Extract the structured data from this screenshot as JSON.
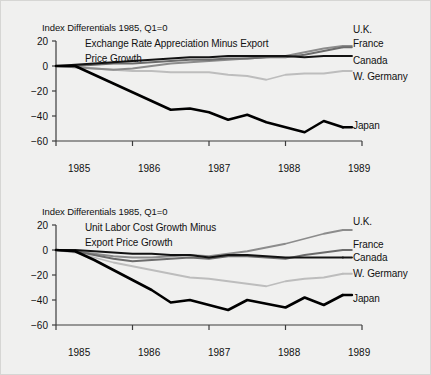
{
  "figure": {
    "background_color": "#f0f0ef",
    "text_color": "#111111"
  },
  "series_colors": {
    "uk": "#8c8c8c",
    "france": "#6b6b6b",
    "canada": "#121212",
    "w_germany": "#bdbdbd",
    "japan": "#000000"
  },
  "panels": [
    {
      "id": "exchange-rate",
      "note": "Index Differentials 1985, Q1=0",
      "subtitle_lines": [
        "Exchange Rate Appreciation Minus Export",
        "Price Growth"
      ],
      "y_ticks": [
        "20",
        "0",
        "−20",
        "−40",
        "−60"
      ],
      "x_ticks": [
        "1985",
        "1986",
        "1987",
        "1988",
        "1989"
      ],
      "series_labels": [
        "U.K.",
        "France",
        "Canada",
        "W. Germany",
        "Japan"
      ]
    },
    {
      "id": "unit-labor-cost",
      "note": "Index Differentials 1985, Q1=0",
      "subtitle_lines": [
        "Unit Labor Cost Growth Minus",
        "Export Price Growth"
      ],
      "y_ticks": [
        "20",
        "0",
        "−20",
        "−40",
        "−60"
      ],
      "x_ticks": [
        "1985",
        "1986",
        "1987",
        "1988",
        "1989"
      ],
      "series_labels": [
        "U.K.",
        "France",
        "Canada",
        "W. Germany",
        "Japan"
      ]
    }
  ],
  "chart_data": [
    {
      "type": "line",
      "title": "Exchange Rate Appreciation Minus Export Price Growth",
      "subtitle": "Index Differentials 1985, Q1=0",
      "xlabel": "",
      "ylabel": "",
      "xlim": [
        1985.0,
        1989.0
      ],
      "ylim": [
        -60,
        20
      ],
      "yticks": [
        20,
        0,
        -20,
        -40,
        -60
      ],
      "xticks": [
        1985,
        1986,
        1987,
        1988,
        1989
      ],
      "grid": false,
      "legend": "right-inline-labels",
      "x": [
        1985.0,
        1985.25,
        1985.5,
        1985.75,
        1986.0,
        1986.25,
        1986.5,
        1986.75,
        1987.0,
        1987.25,
        1987.5,
        1987.75,
        1988.0,
        1988.25,
        1988.5,
        1988.75
      ],
      "series": [
        {
          "name": "U.K.",
          "color": "#8c8c8c",
          "values": [
            0,
            -1,
            -2,
            -3,
            -2,
            0,
            2,
            3,
            4,
            5,
            6,
            7,
            8,
            11,
            14,
            16
          ]
        },
        {
          "name": "France",
          "color": "#6b6b6b",
          "values": [
            0,
            0,
            1,
            2,
            2,
            3,
            4,
            5,
            5,
            6,
            6,
            7,
            7,
            9,
            12,
            15
          ]
        },
        {
          "name": "Canada",
          "color": "#121212",
          "values": [
            0,
            1,
            2,
            3,
            4,
            5,
            6,
            7,
            7,
            8,
            8,
            8,
            8,
            7,
            8,
            8
          ]
        },
        {
          "name": "W. Germany",
          "color": "#bdbdbd",
          "values": [
            0,
            -1,
            -2,
            -3,
            -4,
            -4,
            -5,
            -5,
            -5,
            -7,
            -8,
            -11,
            -7,
            -6,
            -6,
            -4
          ]
        },
        {
          "name": "Japan",
          "color": "#000000",
          "values": [
            0,
            0,
            -7,
            -14,
            -21,
            -28,
            -35,
            -34,
            -37,
            -43,
            -39,
            -45,
            -49,
            -53,
            -44,
            -49
          ]
        }
      ]
    },
    {
      "type": "line",
      "title": "Unit Labor Cost Growth Minus Export Price Growth",
      "subtitle": "Index Differentials 1985, Q1=0",
      "xlabel": "",
      "ylabel": "",
      "xlim": [
        1985.0,
        1989.0
      ],
      "ylim": [
        -60,
        20
      ],
      "yticks": [
        20,
        0,
        -20,
        -40,
        -60
      ],
      "xticks": [
        1985,
        1986,
        1987,
        1988,
        1989
      ],
      "grid": false,
      "legend": "right-inline-labels",
      "x": [
        1985.0,
        1985.25,
        1985.5,
        1985.75,
        1986.0,
        1986.25,
        1986.5,
        1986.75,
        1987.0,
        1987.25,
        1987.5,
        1987.75,
        1988.0,
        1988.25,
        1988.5,
        1988.75
      ],
      "series": [
        {
          "name": "U.K.",
          "color": "#8c8c8c",
          "values": [
            0,
            -1,
            -3,
            -5,
            -6,
            -6,
            -5,
            -4,
            -5,
            -3,
            -1,
            2,
            5,
            9,
            13,
            16
          ]
        },
        {
          "name": "France",
          "color": "#6b6b6b",
          "values": [
            0,
            -1,
            -4,
            -7,
            -9,
            -8,
            -7,
            -6,
            -7,
            -5,
            -5,
            -6,
            -7,
            -4,
            -2,
            0
          ]
        },
        {
          "name": "Canada",
          "color": "#121212",
          "values": [
            0,
            0,
            -1,
            -2,
            -3,
            -3,
            -4,
            -4,
            -6,
            -4,
            -4,
            -5,
            -6,
            -6,
            -6,
            -6
          ]
        },
        {
          "name": "W. Germany",
          "color": "#bdbdbd",
          "values": [
            0,
            -2,
            -6,
            -10,
            -13,
            -16,
            -19,
            -22,
            -23,
            -25,
            -27,
            -29,
            -25,
            -23,
            -22,
            -19
          ]
        },
        {
          "name": "Japan",
          "color": "#000000",
          "values": [
            0,
            -1,
            -8,
            -16,
            -24,
            -32,
            -42,
            -40,
            -44,
            -48,
            -40,
            -43,
            -46,
            -38,
            -44,
            -36
          ]
        }
      ]
    }
  ]
}
